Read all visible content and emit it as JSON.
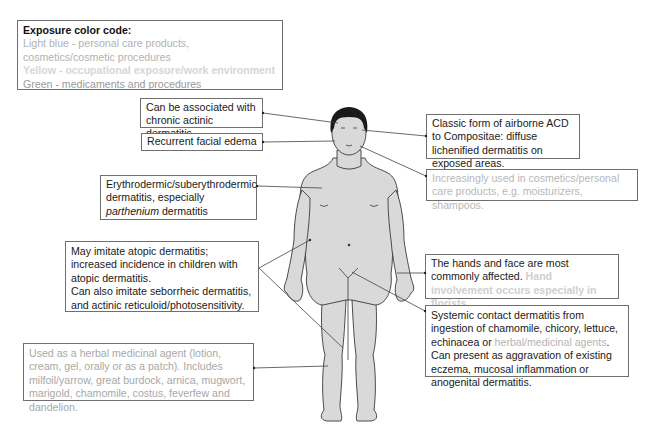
{
  "legend": {
    "title": "Exposure color code:",
    "items": [
      {
        "text": "Light blue - personal care products, cosmetics/cosmetic procedures",
        "color": "#b2b2b2"
      },
      {
        "text": "Yellow - occupational exposure/work environment",
        "color": "#d6d6d6"
      },
      {
        "text": "Green - medicaments and procedures",
        "color": "#9a9a9a"
      }
    ]
  },
  "callouts": {
    "actinic": {
      "text": "Can be associated with chronic actinic dermatitis"
    },
    "edema": {
      "text": "Recurrent facial edema"
    },
    "erythrodermic": {
      "pre": "Erythrodermic/suberythrodermic dermatitis, especially ",
      "italic": "parthenium",
      "post": " dermatitis"
    },
    "atopic": {
      "line1": "May imitate atopic dermatitis; increased incidence in children with atopic dermatitis.",
      "line2": "Can also imitate seborrheic dermatitis, and actinic reticuloid/photosensitivity."
    },
    "herbal": {
      "text": "Used as a herbal medicinal agent (lotion, cream, gel, orally or as a patch). Includes milfoil/yarrow, great burdock, arnica, mugwort, marigold, chamomile, costus, feverfew and dandelion."
    },
    "airborne": {
      "text": "Classic form of airborne ACD to Compositae: diffuse lichenified dermatitis on exposed areas."
    },
    "cosmetics": {
      "text": "Increasingly used in cosmetics/personal care products, e.g. moisturizers, shampoos."
    },
    "hands": {
      "main": "The hands and face are most commonly affected. ",
      "faint": "Hand involvement occurs especially in florists."
    },
    "systemic": {
      "pre": "Systemic contact dermatitis from ingestion of chamomile, chicory, lettuce, echinacea or ",
      "faint": "herbal/medicinal agents",
      "post": ". Can present as aggravation of existing eczema, mucosal inflammation or anogenital dermatitis."
    }
  },
  "figure": {
    "label": "human body front view",
    "skin_color": "#d9d9d9",
    "hair_color": "#1a1a1a"
  }
}
